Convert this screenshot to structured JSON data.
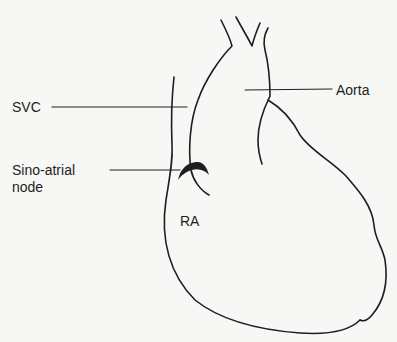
{
  "diagram": {
    "labels": {
      "svc": "SVC",
      "aorta": "Aorta",
      "sa_node_line1": "Sino-atrial",
      "sa_node_line2": "node",
      "ra": "RA"
    },
    "colors": {
      "line": "#1e1e1e",
      "background": "#f7f7f5"
    }
  }
}
